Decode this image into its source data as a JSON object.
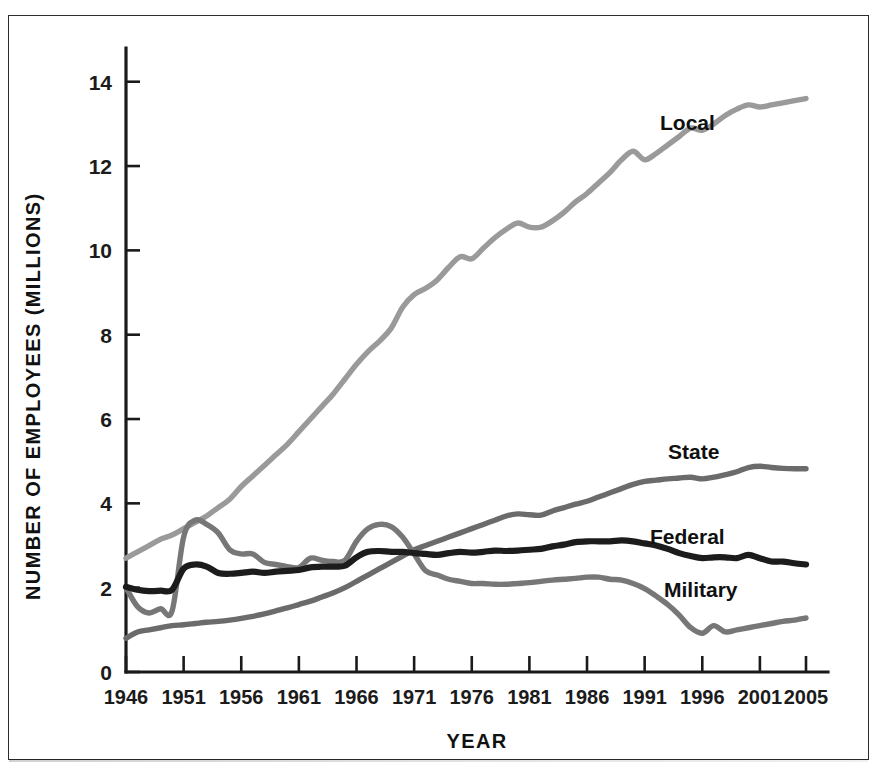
{
  "figure": {
    "top_cropped_text": "",
    "background_color": "#ffffff",
    "frame_color": "#2c2c2c"
  },
  "axes": {
    "y_title": "NUMBER OF EMPLOYEES (MILLIONS)",
    "x_title": "YEAR",
    "y_ticks": [
      "0",
      "2",
      "4",
      "6",
      "8",
      "10",
      "12",
      "14"
    ],
    "x_ticks": [
      "1946",
      "1951",
      "1956",
      "1961",
      "1966",
      "1971",
      "1976",
      "1981",
      "1986",
      "1991",
      "1996",
      "2001",
      "2005"
    ]
  },
  "series_labels": {
    "local": "Local",
    "state": "State",
    "federal": "Federal",
    "military": "Military"
  },
  "colors": {
    "local": "#9a9a9a",
    "state": "#6b6b6b",
    "federal": "#1c1c1c",
    "military": "#777777",
    "axis": "#1a1a1a",
    "text": "#111111"
  },
  "chart_data": {
    "type": "line",
    "title": "",
    "subtitle": "",
    "xlabel": "YEAR",
    "ylabel": "NUMBER OF EMPLOYEES (MILLIONS)",
    "xlim": [
      1946,
      2005
    ],
    "ylim": [
      0,
      14.8
    ],
    "grid": false,
    "legend_position": "inline-annotations",
    "x": [
      1946,
      1947,
      1948,
      1949,
      1950,
      1951,
      1952,
      1953,
      1954,
      1955,
      1956,
      1957,
      1958,
      1959,
      1960,
      1961,
      1962,
      1963,
      1964,
      1965,
      1966,
      1967,
      1968,
      1969,
      1970,
      1971,
      1972,
      1973,
      1974,
      1975,
      1976,
      1977,
      1978,
      1979,
      1980,
      1981,
      1982,
      1983,
      1984,
      1985,
      1986,
      1987,
      1988,
      1989,
      1990,
      1991,
      1992,
      1993,
      1994,
      1995,
      1996,
      1997,
      1998,
      1999,
      2000,
      2001,
      2002,
      2003,
      2004,
      2005
    ],
    "series": [
      {
        "name": "Local",
        "color": "#9a9a9a",
        "annotation": "Local",
        "values": [
          2.7,
          2.85,
          3.0,
          3.15,
          3.25,
          3.4,
          3.55,
          3.7,
          3.9,
          4.1,
          4.4,
          4.65,
          4.9,
          5.15,
          5.4,
          5.7,
          6.0,
          6.3,
          6.6,
          6.95,
          7.3,
          7.6,
          7.85,
          8.15,
          8.65,
          8.95,
          9.1,
          9.3,
          9.6,
          9.85,
          9.8,
          10.05,
          10.3,
          10.5,
          10.65,
          10.55,
          10.55,
          10.7,
          10.9,
          11.15,
          11.35,
          11.6,
          11.85,
          12.15,
          12.35,
          12.15,
          12.3,
          12.5,
          12.7,
          12.9,
          12.85,
          13.0,
          13.2,
          13.35,
          13.45,
          13.4,
          13.45,
          13.5,
          13.55,
          13.6
        ]
      },
      {
        "name": "State",
        "color": "#6b6b6b",
        "annotation": "State",
        "values": [
          0.8,
          0.95,
          1.0,
          1.05,
          1.1,
          1.12,
          1.15,
          1.18,
          1.2,
          1.23,
          1.27,
          1.32,
          1.38,
          1.45,
          1.52,
          1.6,
          1.68,
          1.78,
          1.88,
          2.0,
          2.15,
          2.3,
          2.45,
          2.6,
          2.75,
          2.9,
          3.0,
          3.1,
          3.2,
          3.3,
          3.4,
          3.5,
          3.6,
          3.7,
          3.75,
          3.73,
          3.72,
          3.82,
          3.9,
          3.98,
          4.05,
          4.15,
          4.25,
          4.35,
          4.45,
          4.52,
          4.55,
          4.58,
          4.6,
          4.62,
          4.58,
          4.62,
          4.68,
          4.75,
          4.85,
          4.88,
          4.85,
          4.83,
          4.82,
          4.82
        ]
      },
      {
        "name": "Federal",
        "color": "#1c1c1c",
        "annotation": "Federal",
        "values": [
          2.02,
          1.95,
          1.92,
          1.93,
          1.95,
          2.45,
          2.55,
          2.5,
          2.35,
          2.33,
          2.35,
          2.38,
          2.35,
          2.38,
          2.4,
          2.42,
          2.48,
          2.5,
          2.5,
          2.52,
          2.72,
          2.85,
          2.87,
          2.85,
          2.85,
          2.82,
          2.8,
          2.78,
          2.82,
          2.85,
          2.83,
          2.85,
          2.88,
          2.87,
          2.88,
          2.9,
          2.92,
          2.98,
          3.02,
          3.08,
          3.1,
          3.1,
          3.1,
          3.12,
          3.1,
          3.05,
          3.0,
          2.92,
          2.82,
          2.75,
          2.7,
          2.72,
          2.72,
          2.7,
          2.78,
          2.7,
          2.62,
          2.62,
          2.58,
          2.55
        ]
      },
      {
        "name": "Military",
        "color": "#777777",
        "annotation": "Military",
        "values": [
          2.0,
          1.55,
          1.4,
          1.5,
          1.45,
          3.2,
          3.6,
          3.5,
          3.3,
          2.9,
          2.8,
          2.8,
          2.6,
          2.55,
          2.5,
          2.48,
          2.7,
          2.65,
          2.62,
          2.65,
          3.1,
          3.4,
          3.5,
          3.45,
          3.2,
          2.8,
          2.4,
          2.3,
          2.2,
          2.15,
          2.1,
          2.1,
          2.08,
          2.08,
          2.1,
          2.12,
          2.15,
          2.18,
          2.2,
          2.22,
          2.25,
          2.25,
          2.2,
          2.18,
          2.1,
          1.98,
          1.8,
          1.6,
          1.35,
          1.05,
          0.92,
          1.1,
          0.95,
          1.0,
          1.05,
          1.1,
          1.15,
          1.2,
          1.23,
          1.28
        ]
      }
    ]
  }
}
